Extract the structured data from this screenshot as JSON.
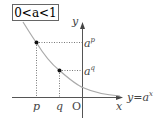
{
  "condition_label": "0<a<1",
  "axes": {
    "x_label": "x",
    "y_label": "y",
    "origin_label": "O"
  },
  "points": [
    {
      "x_label": "p",
      "y_label_base": "a",
      "y_label_exp": "p"
    },
    {
      "x_label": "q",
      "y_label_base": "a",
      "y_label_exp": "q"
    }
  ],
  "curve_label": {
    "lhs": "y",
    "eq": "=",
    "base": "a",
    "exp": "x"
  },
  "colors": {
    "curve": "#aaaaaa",
    "axis": "#555555",
    "guide": "#555555"
  }
}
